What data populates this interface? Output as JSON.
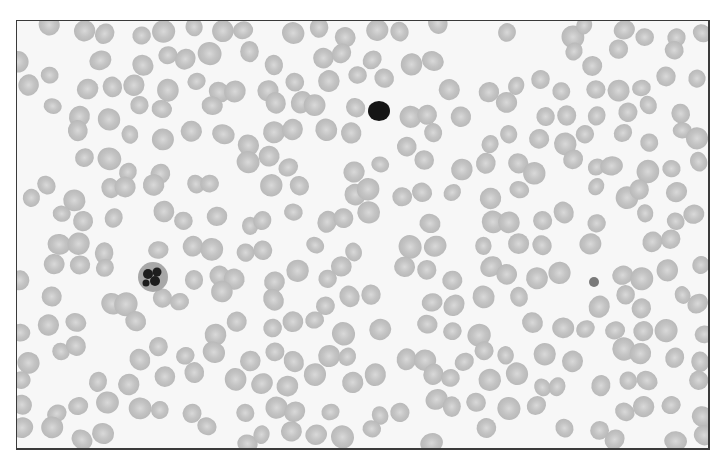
{
  "image": {
    "subject": "blood smear micrograph",
    "colors": {
      "background": "#f7f7f7",
      "rbc_fill": "#c4c4c4",
      "rbc_center": "#d9d9d9",
      "neutrophil_nucleus": "#1e1e1e",
      "neutrophil_cytoplasm": "#a8a8a8",
      "lymphocyte": "#151515",
      "platelet": "#7a7a7a",
      "border": "#3a3a3a"
    },
    "special_cells": [
      {
        "type": "neutrophil",
        "x": 152,
        "y": 276,
        "r": 15
      },
      {
        "type": "small-lymphocyte",
        "x": 378,
        "y": 110,
        "r": 11
      },
      {
        "type": "platelet",
        "x": 593,
        "y": 281,
        "r": 5
      }
    ]
  }
}
